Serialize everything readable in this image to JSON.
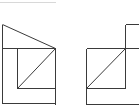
{
  "diagram": {
    "type": "orthographic-views",
    "stroke_color": "#3a3a3a",
    "background": "#ffffff",
    "views": [
      {
        "name": "left-view"
      },
      {
        "name": "right-view"
      }
    ]
  }
}
